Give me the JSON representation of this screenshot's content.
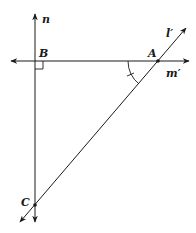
{
  "diagram": {
    "type": "geometry",
    "colors": {
      "stroke": "#1a1a1a",
      "background": "#ffffff"
    },
    "lines": [
      {
        "id": "n",
        "label": "n",
        "description": "vertical line through B and C"
      },
      {
        "id": "m_prime",
        "label": "m′",
        "description": "horizontal line through B and A"
      },
      {
        "id": "l_prime",
        "label": "l′",
        "description": "oblique line through A and C"
      }
    ],
    "points": [
      {
        "id": "A",
        "label": "A"
      },
      {
        "id": "B",
        "label": "B"
      },
      {
        "id": "C",
        "label": "C"
      }
    ],
    "annotations": [
      {
        "type": "right-angle",
        "at": "B"
      },
      {
        "type": "angle-arc-with-tick",
        "at": "A",
        "between": [
          "AB",
          "AC"
        ]
      }
    ]
  }
}
